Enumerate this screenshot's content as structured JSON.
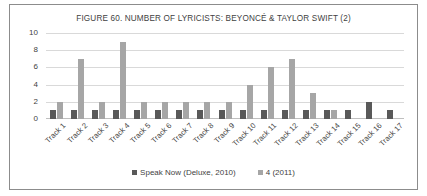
{
  "chart_data": {
    "type": "bar",
    "title": "FIGURE 60. NUMBER OF LYRICISTS: BEYONCÉ & TAYLOR SWIFT (2)",
    "xlabel": "",
    "ylabel": "",
    "ylim": [
      0,
      10
    ],
    "yticks": [
      0,
      2,
      4,
      6,
      8,
      10
    ],
    "grid": true,
    "legend_position": "bottom",
    "categories": [
      "Track 1",
      "Track 2",
      "Track 3",
      "Track 4",
      "Track 5",
      "Track 6",
      "Track 7",
      "Track 8",
      "Track 9",
      "Track 10",
      "Track 11",
      "Track 12",
      "Track 13",
      "Track 14",
      "Track 15",
      "Track 16",
      "Track 17"
    ],
    "series": [
      {
        "name": "Speak Now (Deluxe, 2010)",
        "color": "#595959",
        "values": [
          1,
          1,
          1,
          1,
          1,
          1,
          1,
          1,
          1,
          1,
          1,
          1,
          1,
          1,
          1,
          2,
          1
        ]
      },
      {
        "name": "4 (2011)",
        "color": "#a6a6a6",
        "values": [
          2,
          7,
          2,
          9,
          2,
          2,
          2,
          2,
          2,
          4,
          6,
          7,
          3,
          1,
          0,
          0,
          0
        ]
      }
    ]
  }
}
